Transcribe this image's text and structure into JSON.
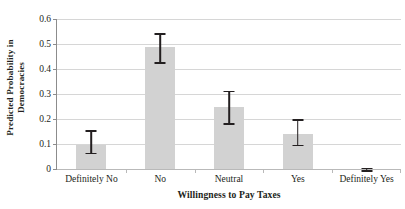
{
  "chart_data": {
    "type": "bar",
    "title": "",
    "xlabel": "Willingness to Pay Taxes",
    "ylabel_line1": "Predicted Probability in",
    "ylabel_line2": "Democracies",
    "categories": [
      "Definitely No",
      "No",
      "Neutral",
      "Yes",
      "Definitely Yes"
    ],
    "values": [
      0.098,
      0.487,
      0.248,
      0.141,
      0.0
    ],
    "error_low": [
      0.066,
      0.428,
      0.183,
      0.098,
      -0.004
    ],
    "error_high": [
      0.155,
      0.544,
      0.313,
      0.2,
      0.006
    ],
    "ylim": [
      0,
      0.6
    ],
    "yticks": [
      0,
      0.1,
      0.2,
      0.3,
      0.4,
      0.5,
      0.6
    ],
    "ytick_labels": [
      "0",
      "0.1",
      "0.2",
      "0.3",
      "0.4",
      "0.5",
      "0.6"
    ],
    "grid": "horizontal",
    "legend": "none",
    "bar_color": "#d2d2d2",
    "error_color": "#231f20",
    "grid_color": "#d6d6d6",
    "axis_color": "#8c8c8c"
  }
}
